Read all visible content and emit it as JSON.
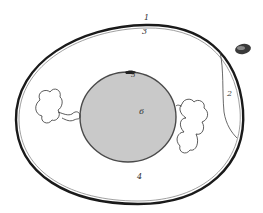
{
  "figure": {
    "labels": [
      {
        "id": "1",
        "text": "1",
        "x": 144,
        "y": 15
      },
      {
        "id": "2",
        "text": "2",
        "x": 227,
        "y": 90
      },
      {
        "id": "3",
        "text": "3",
        "x": 142,
        "y": 28
      },
      {
        "id": "4",
        "text": "4",
        "x": 137,
        "y": 173
      },
      {
        "id": "5",
        "text": "5",
        "x": 131,
        "y": 72
      },
      {
        "id": "6",
        "text": "6",
        "x": 139,
        "y": 108
      }
    ],
    "colors": {
      "shell": "#1a1a1a",
      "yolk_fill": "#c9c9c9",
      "yolk_stroke": "#555555",
      "background": "#ffffff"
    }
  }
}
